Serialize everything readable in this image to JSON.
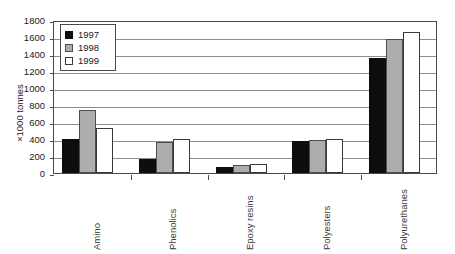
{
  "title_fragment": "",
  "chart_data": {
    "type": "bar",
    "title": "",
    "subtitle": "",
    "xlabel": "",
    "ylabel": "×1000 tonnes",
    "ylim": [
      0,
      1800
    ],
    "ytick_step": 200,
    "yticks": [
      0,
      200,
      400,
      600,
      800,
      1000,
      1200,
      1400,
      1600,
      1800
    ],
    "ytick_labels": [
      "0",
      "200",
      "400",
      "600",
      "800",
      "1000",
      "1200",
      "1400",
      "1600",
      "1800"
    ],
    "grid": true,
    "grid_axis": "y",
    "legend_position": "top-left",
    "categories": [
      "Amino",
      "Phenolics",
      "Epoxy resins",
      "Polyesters",
      "Polyurethanes"
    ],
    "series": [
      {
        "name": "1997",
        "color": "#0d0d0d",
        "values": [
          400,
          165,
          70,
          375,
          1355
        ]
      },
      {
        "name": "1998",
        "color": "#adadad",
        "values": [
          745,
          365,
          90,
          385,
          1580
        ]
      },
      {
        "name": "1999",
        "color": "#ffffff",
        "values": [
          535,
          405,
          105,
          405,
          1660
        ]
      }
    ]
  },
  "legend": {
    "items": [
      {
        "label": "1997",
        "swatch": "s1997"
      },
      {
        "label": "1998",
        "swatch": "s1998"
      },
      {
        "label": "1999",
        "swatch": "s1999"
      }
    ]
  }
}
